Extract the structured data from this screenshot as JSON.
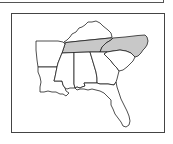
{
  "map": {
    "title": "",
    "region": "Southeastern United States",
    "highlight_color": "#c8c8c8",
    "base_color": "#ffffff",
    "border_color": "#222222",
    "states": [
      {
        "id": "KY",
        "name": "Kentucky",
        "highlighted": false
      },
      {
        "id": "TN",
        "name": "Tennessee",
        "highlighted": true
      },
      {
        "id": "NC",
        "name": "North Carolina",
        "highlighted": true
      },
      {
        "id": "AR",
        "name": "Arkansas",
        "highlighted": false
      },
      {
        "id": "LA",
        "name": "Louisiana",
        "highlighted": false
      },
      {
        "id": "MS",
        "name": "Mississippi",
        "highlighted": false
      },
      {
        "id": "AL",
        "name": "Alabama",
        "highlighted": false
      },
      {
        "id": "GA",
        "name": "Georgia",
        "highlighted": false
      },
      {
        "id": "SC",
        "name": "South Carolina",
        "highlighted": false
      },
      {
        "id": "FL",
        "name": "Florida",
        "highlighted": false
      }
    ]
  }
}
